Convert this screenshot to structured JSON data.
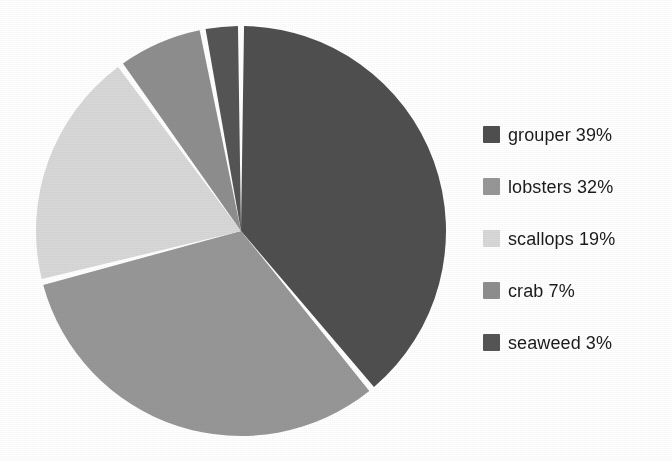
{
  "chart_data": {
    "type": "pie",
    "title": "",
    "subtitle": "",
    "xlabel": "",
    "ylabel": "",
    "categories": [
      "grouper",
      "lobsters",
      "scallops",
      "crab",
      "seaweed"
    ],
    "values": [
      39,
      32,
      19,
      7,
      3
    ],
    "value_unit": "%",
    "slices": [
      {
        "label": "grouper",
        "value": 39,
        "display": "grouper 39%",
        "color": "#4f4f4f",
        "start_angle_deg": 0,
        "end_angle_deg": 140.4
      },
      {
        "label": "lobsters",
        "value": 32,
        "display": "lobsters 32%",
        "color": "#979797",
        "start_angle_deg": 140.4,
        "end_angle_deg": 255.6
      },
      {
        "label": "scallops",
        "value": 19,
        "display": "scallops 19%",
        "color": "#d8d8d8",
        "start_angle_deg": 255.6,
        "end_angle_deg": 324.0
      },
      {
        "label": "crab",
        "value": 7,
        "display": "crab 7%",
        "color": "#8e8e8e",
        "start_angle_deg": 324.0,
        "end_angle_deg": 349.2
      },
      {
        "label": "seaweed",
        "value": 3,
        "display": "seaweed 3%",
        "color": "#555555",
        "start_angle_deg": 349.2,
        "end_angle_deg": 360.0
      }
    ],
    "start_angle_deg": 0,
    "direction": "clockwise",
    "slice_gap": true,
    "slice_gap_color": "#ffffff",
    "grid": false,
    "legend_position": "right",
    "legend": [
      {
        "label": "grouper 39%",
        "color": "#4f4f4f"
      },
      {
        "label": "lobsters 32%",
        "color": "#979797"
      },
      {
        "label": "scallops 19%",
        "color": "#d8d8d8"
      },
      {
        "label": "crab 7%",
        "color": "#8e8e8e"
      },
      {
        "label": "seaweed 3%",
        "color": "#555555"
      }
    ]
  },
  "legend": {
    "items": [
      {
        "label": "grouper 39%"
      },
      {
        "label": "lobsters 32%"
      },
      {
        "label": "scallops 19%"
      },
      {
        "label": "crab 7%"
      },
      {
        "label": "seaweed 3%"
      }
    ]
  }
}
